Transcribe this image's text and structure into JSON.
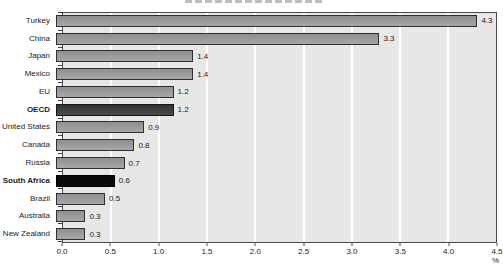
{
  "colors": {
    "bar_gray": "#9b9b9b",
    "bar_dark_gray": "#3e3e3e",
    "bar_black": "#0a0a0a",
    "bar_border": "#2f2f2f",
    "plot_background": "#e7e7e7",
    "plot_border": "#4a4a4a",
    "gridline": "#ffffff",
    "text": "#1a1a1a"
  },
  "chart_data": {
    "type": "bar",
    "orientation": "horizontal",
    "title": "",
    "xlabel": "",
    "ylabel": "",
    "unit_label": "%",
    "xlim": [
      0,
      4.5
    ],
    "xticks": [
      "0.0",
      "0.5",
      "1.0",
      "1.5",
      "2.0",
      "2.5",
      "3.0",
      "3.5",
      "4.0",
      "4.5"
    ],
    "grid": "vertical white gridlines every 0.5 on light gray panel",
    "legend": "none",
    "categories": [
      "Turkey",
      "China",
      "Japan",
      "Mexico",
      "EU",
      "OECD",
      "United States",
      "Canada",
      "Russia",
      "South Africa",
      "Brazil",
      "Australia",
      "New Zealand"
    ],
    "values": [
      4.3,
      3.3,
      1.4,
      1.4,
      1.2,
      1.2,
      0.9,
      0.8,
      0.7,
      0.6,
      0.5,
      0.3,
      0.3
    ],
    "rows": [
      {
        "label": "Turkey",
        "value": 4.3,
        "display": "4.3",
        "style": "gray",
        "bold": false
      },
      {
        "label": "China",
        "value": 3.3,
        "display": "3.3",
        "style": "gray",
        "bold": false
      },
      {
        "label": "Japan",
        "value": 1.4,
        "display": "1.4",
        "style": "gray",
        "bold": false
      },
      {
        "label": "Mexico",
        "value": 1.4,
        "display": "1.4",
        "style": "gray",
        "bold": false
      },
      {
        "label": "EU",
        "value": 1.2,
        "display": "1.2",
        "style": "gray",
        "bold": false
      },
      {
        "label": "OECD",
        "value": 1.2,
        "display": "1.2",
        "style": "dark",
        "bold": true
      },
      {
        "label": "United States",
        "value": 0.9,
        "display": "0.9",
        "style": "gray",
        "bold": false
      },
      {
        "label": "Canada",
        "value": 0.8,
        "display": "0.8",
        "style": "gray",
        "bold": false
      },
      {
        "label": "Russia",
        "value": 0.7,
        "display": "0.7",
        "style": "gray",
        "bold": false
      },
      {
        "label": "South Africa",
        "value": 0.6,
        "display": "0.6",
        "style": "black",
        "bold": true
      },
      {
        "label": "Brazil",
        "value": 0.5,
        "display": "0.5",
        "style": "gray",
        "bold": false
      },
      {
        "label": "Australia",
        "value": 0.3,
        "display": "0.3",
        "style": "gray",
        "bold": false
      },
      {
        "label": "New Zealand",
        "value": 0.3,
        "display": "0.3",
        "style": "gray",
        "bold": false
      }
    ]
  }
}
